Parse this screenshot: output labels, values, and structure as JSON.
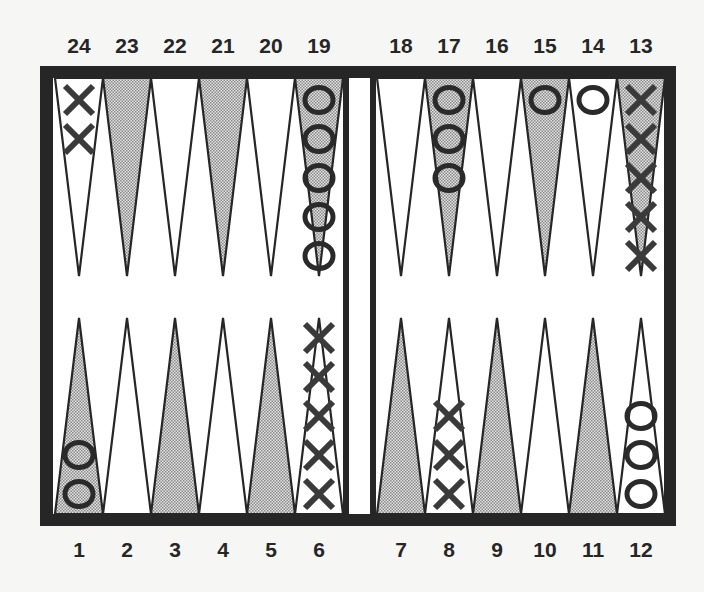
{
  "game": "Backgammon",
  "colors": {
    "background": "#f6f6f4",
    "frame": "#262626",
    "point_light": "#ffffff",
    "point_shaded": "#c4c4c4",
    "checker_ink": "#2a2a2a"
  },
  "top_labels": [
    "24",
    "23",
    "22",
    "21",
    "20",
    "19",
    "18",
    "17",
    "16",
    "15",
    "14",
    "13"
  ],
  "bottom_labels": [
    "1",
    "2",
    "3",
    "4",
    "5",
    "6",
    "7",
    "8",
    "9",
    "10",
    "11",
    "12"
  ],
  "points": [
    {
      "number": 1,
      "shaded": true,
      "checker": "O",
      "count": 2
    },
    {
      "number": 2,
      "shaded": false,
      "checker": "",
      "count": 0
    },
    {
      "number": 3,
      "shaded": true,
      "checker": "",
      "count": 0
    },
    {
      "number": 4,
      "shaded": false,
      "checker": "",
      "count": 0
    },
    {
      "number": 5,
      "shaded": true,
      "checker": "",
      "count": 0
    },
    {
      "number": 6,
      "shaded": false,
      "checker": "X",
      "count": 5
    },
    {
      "number": 7,
      "shaded": true,
      "checker": "",
      "count": 0
    },
    {
      "number": 8,
      "shaded": false,
      "checker": "X",
      "count": 3
    },
    {
      "number": 9,
      "shaded": true,
      "checker": "",
      "count": 0
    },
    {
      "number": 10,
      "shaded": false,
      "checker": "",
      "count": 0
    },
    {
      "number": 11,
      "shaded": true,
      "checker": "",
      "count": 0
    },
    {
      "number": 12,
      "shaded": false,
      "checker": "O",
      "count": 3
    },
    {
      "number": 13,
      "shaded": true,
      "checker": "X",
      "count": 5
    },
    {
      "number": 14,
      "shaded": false,
      "checker": "O",
      "count": 1
    },
    {
      "number": 15,
      "shaded": true,
      "checker": "O",
      "count": 1
    },
    {
      "number": 16,
      "shaded": false,
      "checker": "",
      "count": 0
    },
    {
      "number": 17,
      "shaded": true,
      "checker": "O",
      "count": 3
    },
    {
      "number": 18,
      "shaded": false,
      "checker": "",
      "count": 0
    },
    {
      "number": 19,
      "shaded": true,
      "checker": "O",
      "count": 5
    },
    {
      "number": 20,
      "shaded": false,
      "checker": "",
      "count": 0
    },
    {
      "number": 21,
      "shaded": true,
      "checker": "",
      "count": 0
    },
    {
      "number": 22,
      "shaded": false,
      "checker": "",
      "count": 0
    },
    {
      "number": 23,
      "shaded": true,
      "checker": "",
      "count": 0
    },
    {
      "number": 24,
      "shaded": false,
      "checker": "X",
      "count": 2
    }
  ]
}
